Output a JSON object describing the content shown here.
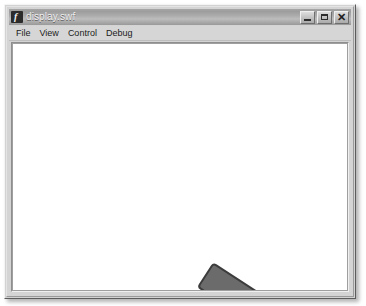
{
  "window": {
    "title": "display.swf",
    "icon": "flash-player-icon",
    "icon_glyph": "f",
    "controls": [
      {
        "name": "minimize-button",
        "glyph": "minimize-icon",
        "label": "Minimize"
      },
      {
        "name": "maximize-button",
        "glyph": "maximize-icon",
        "label": "Maximize"
      },
      {
        "name": "close-button",
        "glyph": "close-icon",
        "label": "Close",
        "symbol": "✕"
      }
    ]
  },
  "menubar": {
    "items": [
      {
        "label": "File"
      },
      {
        "label": "View"
      },
      {
        "label": "Control"
      },
      {
        "label": "Debug"
      }
    ]
  },
  "stage": {
    "background_color": "#ffffff",
    "objects": [
      {
        "name": "rotating-bar",
        "shape": "rounded-rectangle",
        "fill_color": "#6b6b6b",
        "stroke_color": "#3c3c3c",
        "rotation_degrees": -57,
        "width": 30,
        "height": 104
      }
    ]
  },
  "colors": {
    "titlebar_gradient_top": "#a6a6a6",
    "titlebar_gradient_bottom": "#999999",
    "titlebar_text": "#efefef",
    "menubar_background": "#d6d6d6",
    "window_face": "#d4d4d4",
    "stage_white": "#ffffff",
    "bar_fill": "#6b6b6b",
    "bar_stroke": "#3c3c3c"
  }
}
